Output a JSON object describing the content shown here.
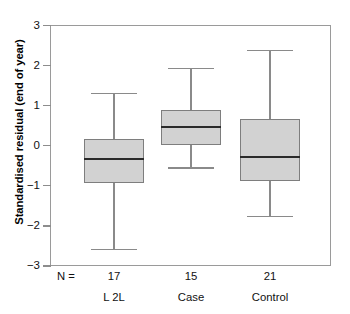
{
  "chart_data": {
    "type": "box",
    "title": "",
    "xlabel": "",
    "ylabel": "Standardised residual (end of year)",
    "ylim": [
      -3,
      3
    ],
    "yticks": [
      3,
      2,
      1,
      0,
      -1,
      -2,
      -3
    ],
    "ytick_labels": [
      "3",
      "2",
      "1",
      "0",
      "-1",
      "-2",
      "-3"
    ],
    "grid": false,
    "legend": null,
    "n_prefix": "N =",
    "categories": [
      "L 2L",
      "Case",
      "Control"
    ],
    "counts": [
      17,
      15,
      21
    ],
    "boxes": [
      {
        "category": "L 2L",
        "n": 17,
        "whisker_high": 1.32,
        "q3": 0.17,
        "median": -0.32,
        "q1": -0.94,
        "whisker_low": -2.57
      },
      {
        "category": "Case",
        "n": 15,
        "whisker_high": 1.95,
        "q3": 0.88,
        "median": 0.47,
        "q1": 0.02,
        "whisker_low": -0.54
      },
      {
        "category": "Control",
        "n": 21,
        "whisker_high": 2.4,
        "q3": 0.67,
        "median": -0.27,
        "q1": -0.88,
        "whisker_low": -1.75
      }
    ],
    "colors": {
      "box_fill": "#d2d2d2",
      "box_border": "#7e7e7e",
      "median": "#2b2b2b",
      "whisker": "#8a8a8a",
      "frame": "#9a9a9a",
      "text": "#111111",
      "background": "#ffffff"
    }
  }
}
